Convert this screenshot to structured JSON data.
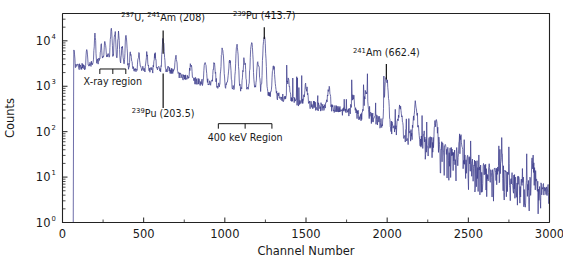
{
  "figure": {
    "background_color": "#ffffff",
    "frame_color": "#222222",
    "trace_color": "#3d3d8c"
  },
  "chart_data": {
    "type": "line",
    "title": "",
    "xlabel": "Channel Number",
    "ylabel": "Counts",
    "xlim": [
      0,
      3000
    ],
    "ylim": [
      1,
      40000
    ],
    "yscale": "log",
    "xscale": "linear",
    "grid": false,
    "legend": null,
    "xticks": [
      0,
      500,
      1000,
      1500,
      2000,
      2500,
      3000
    ],
    "xticklabels": [
      "0",
      "500",
      "1000",
      "1500",
      "2000",
      "2500",
      "3000"
    ],
    "yticks": [
      1,
      10,
      100,
      1000,
      10000
    ],
    "yticklabels": [
      "10^0",
      "10^1",
      "10^2",
      "10^3",
      "10^4"
    ],
    "yticklabels_display": [
      "10",
      "10",
      "10",
      "10",
      "10"
    ],
    "ytick_exponents": [
      "0",
      "1",
      "2",
      "3",
      "4"
    ],
    "series_name": "gamma-ray spectrum",
    "annotations": [
      {
        "id": "x-ray-region",
        "kind": "bracket-below",
        "label": "X-ray region",
        "x_start": 230,
        "x_end": 390,
        "bracket_y": 2400,
        "label_x": 310,
        "label_y": 1050
      },
      {
        "id": "pu-203",
        "kind": "leader-below",
        "label": "Pu (203.5)",
        "isotope_mass": "239",
        "element": "Pu",
        "energy_kev": 203.5,
        "x": 620,
        "y_top": 1900,
        "y_bottom": 330,
        "label_x": 620,
        "label_y": 210
      },
      {
        "id": "u237-am241-208",
        "kind": "leader-above",
        "label": "U,   Am (208)",
        "isotope_mass_1": "237",
        "element_1": "U",
        "isotope_mass_2": "241",
        "element_2": "Am",
        "energy_kev": 208,
        "x": 620,
        "y_bottom": 5200,
        "y_top": 17000,
        "label_x": 620,
        "label_y": 28000
      },
      {
        "id": "pu-413",
        "kind": "leader-above",
        "label": "Pu (413.7)",
        "isotope_mass": "239",
        "element": "Pu",
        "energy_kev": 413.7,
        "x": 1243,
        "y_bottom": 11000,
        "y_top": 20000,
        "label_x": 1243,
        "label_y": 30000
      },
      {
        "id": "kev-400-region",
        "kind": "bracket-below",
        "label": "400 keV Region",
        "x_start": 960,
        "x_end": 1290,
        "bracket_y": 150,
        "label_x": 1125,
        "label_y": 62
      },
      {
        "id": "am-662",
        "kind": "leader-above",
        "label": "Am (662.4)",
        "isotope_mass": "241",
        "element": "Am",
        "energy_kev": 662.4,
        "x": 1995,
        "y_bottom": 1400,
        "y_top": 3100,
        "label_x": 1995,
        "label_y": 4600
      }
    ],
    "peaks": [
      {
        "channel": 70,
        "counts": 3000,
        "name": "low-energy-cutoff"
      },
      {
        "channel": 150,
        "counts": 3200
      },
      {
        "channel": 200,
        "counts": 9500
      },
      {
        "channel": 238,
        "counts": 3600
      },
      {
        "channel": 262,
        "counts": 5600
      },
      {
        "channel": 300,
        "counts": 13000
      },
      {
        "channel": 323,
        "counts": 12000
      },
      {
        "channel": 345,
        "counts": 11000
      },
      {
        "channel": 368,
        "counts": 4200
      },
      {
        "channel": 392,
        "counts": 11500
      },
      {
        "channel": 420,
        "counts": 3200
      },
      {
        "channel": 470,
        "counts": 2900
      },
      {
        "channel": 520,
        "counts": 2800
      },
      {
        "channel": 570,
        "counts": 2700
      },
      {
        "channel": 620,
        "counts": 8600,
        "label": "203.5 keV"
      },
      {
        "channel": 700,
        "counts": 2400
      },
      {
        "channel": 790,
        "counts": 1800
      },
      {
        "channel": 880,
        "counts": 2600
      },
      {
        "channel": 935,
        "counts": 2100
      },
      {
        "channel": 985,
        "counts": 6200
      },
      {
        "channel": 1030,
        "counts": 2600
      },
      {
        "channel": 1075,
        "counts": 6400
      },
      {
        "channel": 1120,
        "counts": 3100
      },
      {
        "channel": 1165,
        "counts": 7600
      },
      {
        "channel": 1205,
        "counts": 2600
      },
      {
        "channel": 1243,
        "counts": 11000,
        "label": "413.7 keV"
      },
      {
        "channel": 1300,
        "counts": 2100
      },
      {
        "channel": 1390,
        "counts": 800
      },
      {
        "channel": 1500,
        "counts": 620
      },
      {
        "channel": 1640,
        "counts": 560
      },
      {
        "channel": 1790,
        "counts": 400
      },
      {
        "channel": 1870,
        "counts": 620
      },
      {
        "channel": 1995,
        "counts": 1400,
        "label": "662.4 keV"
      },
      {
        "channel": 2080,
        "counts": 230
      },
      {
        "channel": 2175,
        "counts": 330
      },
      {
        "channel": 2300,
        "counts": 110
      },
      {
        "channel": 2450,
        "counts": 40
      },
      {
        "channel": 2700,
        "counts": 22
      },
      {
        "channel": 2900,
        "counts": 14
      }
    ],
    "continuum": [
      {
        "channel": 70,
        "counts": 2900
      },
      {
        "channel": 150,
        "counts": 2700
      },
      {
        "channel": 280,
        "counts": 4800
      },
      {
        "channel": 400,
        "counts": 2600
      },
      {
        "channel": 560,
        "counts": 2300
      },
      {
        "channel": 640,
        "counts": 2500
      },
      {
        "channel": 760,
        "counts": 1500
      },
      {
        "channel": 900,
        "counts": 1150
      },
      {
        "channel": 1050,
        "counts": 950
      },
      {
        "channel": 1200,
        "counts": 780
      },
      {
        "channel": 1320,
        "counts": 620
      },
      {
        "channel": 1500,
        "counts": 420
      },
      {
        "channel": 1700,
        "counts": 300
      },
      {
        "channel": 1900,
        "counts": 210
      },
      {
        "channel": 2100,
        "counts": 95
      },
      {
        "channel": 2300,
        "counts": 42
      },
      {
        "channel": 2500,
        "counts": 18
      },
      {
        "channel": 2700,
        "counts": 9
      },
      {
        "channel": 2900,
        "counts": 5
      },
      {
        "channel": 3000,
        "counts": 4
      }
    ]
  }
}
